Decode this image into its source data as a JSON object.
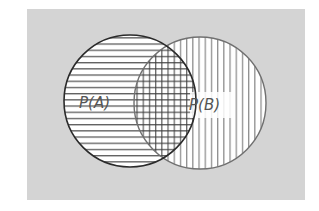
{
  "diagram": {
    "type": "venn",
    "background_color": "#d4d4d4",
    "sets": [
      {
        "id": "A",
        "label": "P(A)",
        "hatch": "horizontal",
        "stroke": "#2a2a2a"
      },
      {
        "id": "B",
        "label": "P(B)",
        "hatch": "vertical",
        "stroke": "#6a6a6a"
      }
    ],
    "intersection": {
      "hatch": "crosshatch"
    }
  }
}
